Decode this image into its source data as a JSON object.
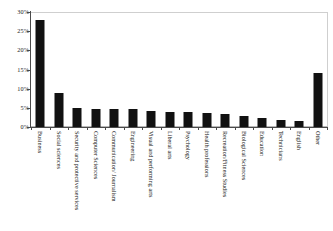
{
  "chart_data": {
    "type": "bar",
    "title": "",
    "subtitle": "",
    "xlabel": "",
    "ylabel": "",
    "ylim": [
      0,
      30
    ],
    "ytick_labels": [
      "30%",
      "25%",
      "20%",
      "15%",
      "10%",
      "5%",
      "0%"
    ],
    "ytick_values": [
      30,
      25,
      20,
      15,
      10,
      5,
      0
    ],
    "grid": false,
    "legend": null,
    "bar_color": "#111111",
    "categories": [
      "Business",
      "Social sciences",
      "Security and protective services",
      "Computer Sciences",
      "Communication/ Journalism",
      "Engineering",
      "Visual and performing arts",
      "Liberal arts",
      "Psychology",
      "Health professions",
      "Recreation/Fitness Studies",
      "Biological Sciences",
      "Education",
      "Technicians",
      "English",
      "Other"
    ],
    "values": [
      28.0,
      9.0,
      5.0,
      4.7,
      4.7,
      4.6,
      4.2,
      4.0,
      3.8,
      3.6,
      3.4,
      3.0,
      2.3,
      1.7,
      1.5,
      14.0
    ]
  },
  "axis": {
    "y_max_label": "30%",
    "y_min_label": "0%"
  }
}
